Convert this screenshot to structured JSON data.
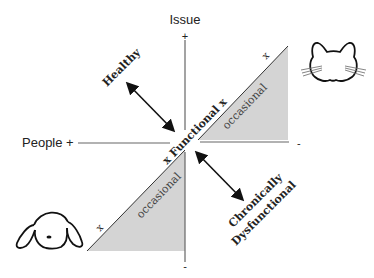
{
  "axes": {
    "vertical_label": "Issue",
    "vertical_plus": "+",
    "vertical_minus": "-",
    "horizontal_label": "People +",
    "horizontal_minus": "-"
  },
  "regions": {
    "healthy": "Healthy",
    "functional": "x Functional x",
    "occasional_upper": "occasional",
    "occasional_lower": "occasional",
    "upper_marker": "x",
    "lower_marker": "x",
    "chronic_line1": "Chronically",
    "chronic_line2": "Dysfunctional"
  },
  "icons": {
    "cat": "cat-face-icon",
    "dog": "dog-face-icon"
  },
  "colors": {
    "shade": "#d4d4d4",
    "line": "#222222",
    "axis": "#555555"
  }
}
